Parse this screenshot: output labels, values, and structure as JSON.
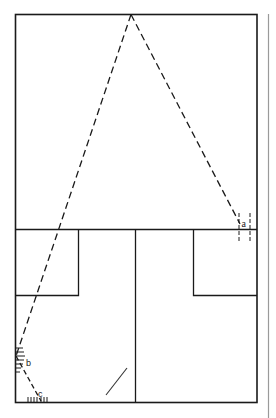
{
  "diagram": {
    "type": "geometric-line-drawing",
    "stroke_color": "#1a1a1a",
    "margin_line_color": "#9a9a9a",
    "labels": {
      "a": "a",
      "b": "b",
      "c": "c"
    }
  }
}
